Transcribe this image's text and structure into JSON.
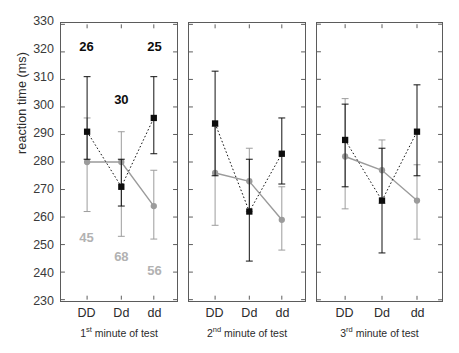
{
  "figure": {
    "ylabel": "reaction time (ms)",
    "y_ticks": [
      330,
      320,
      310,
      300,
      290,
      280,
      270,
      260,
      250,
      240,
      230
    ],
    "x_categories": [
      "DD",
      "Dd",
      "dd"
    ],
    "panel_captions": [
      {
        "ordinal": "1",
        "suffix": "st",
        "rest": " minute of test"
      },
      {
        "ordinal": "2",
        "suffix": "nd",
        "rest": " minute of test"
      },
      {
        "ordinal": "3",
        "suffix": "rd",
        "rest": " minute of test"
      }
    ],
    "colors": {
      "series_black": "#0d0d0d",
      "series_gray": "#9b9b9b",
      "annot_black": "#0d0d0d",
      "annot_gray": "#b2b2b2",
      "frame": "#5b5b5b",
      "background": "#ffffff"
    }
  },
  "chart_data": {
    "type": "line",
    "title": "",
    "xlabel": "",
    "ylabel": "reaction time (ms)",
    "ylim": [
      230,
      330
    ],
    "ytick_step": 10,
    "grid": false,
    "legend": "none",
    "categories": [
      "DD",
      "Dd",
      "dd"
    ],
    "panels": [
      {
        "name": "1st minute of test",
        "caption": "1st minute of test",
        "series": [
          {
            "name": "black",
            "marker": "filled-square",
            "line": "dotted",
            "color": "#0d0d0d",
            "values": [
              291,
              271,
              296
            ],
            "err_low": [
              281,
              264,
              283
            ],
            "err_high": [
              311,
              281,
              311
            ]
          },
          {
            "name": "gray",
            "marker": "filled-circle",
            "line": "solid",
            "color": "#9b9b9b",
            "values": [
              280,
              280,
              264
            ],
            "err_low": [
              262,
              253,
              252
            ],
            "err_high": [
              296,
              291,
              277
            ]
          }
        ],
        "annotations": [
          {
            "text": "26",
            "category": "DD",
            "color": "black",
            "y": 321
          },
          {
            "text": "30",
            "category": "Dd",
            "color": "black",
            "y": 302
          },
          {
            "text": "25",
            "category": "dd",
            "color": "black",
            "y": 321
          },
          {
            "text": "45",
            "category": "DD",
            "color": "gray",
            "y": 253
          },
          {
            "text": "68",
            "category": "Dd",
            "color": "gray",
            "y": 246
          },
          {
            "text": "56",
            "category": "dd",
            "color": "gray",
            "y": 241
          }
        ]
      },
      {
        "name": "2nd minute of test",
        "caption": "2nd minute of test",
        "series": [
          {
            "name": "black",
            "marker": "filled-square",
            "line": "dotted",
            "color": "#0d0d0d",
            "values": [
              294,
              262,
              283
            ],
            "err_low": [
              275,
              244,
              272
            ],
            "err_high": [
              313,
              281,
              296
            ]
          },
          {
            "name": "gray",
            "marker": "filled-circle",
            "line": "solid",
            "color": "#9b9b9b",
            "values": [
              276,
              273,
              259
            ],
            "err_low": [
              257,
              262,
              248
            ],
            "err_high": [
              293,
              285,
              271
            ]
          }
        ],
        "annotations": []
      },
      {
        "name": "3rd minute of test",
        "caption": "3rd minute of test",
        "series": [
          {
            "name": "black",
            "marker": "filled-square",
            "line": "dotted",
            "color": "#0d0d0d",
            "values": [
              288,
              266,
              291
            ],
            "err_low": [
              271,
              247,
              275
            ],
            "err_high": [
              301,
              285,
              308
            ]
          },
          {
            "name": "gray",
            "marker": "filled-circle",
            "line": "solid",
            "color": "#9b9b9b",
            "values": [
              282,
              277,
              266
            ],
            "err_low": [
              263,
              265,
              252
            ],
            "err_high": [
              303,
              288,
              279
            ]
          }
        ],
        "annotations": []
      }
    ]
  }
}
